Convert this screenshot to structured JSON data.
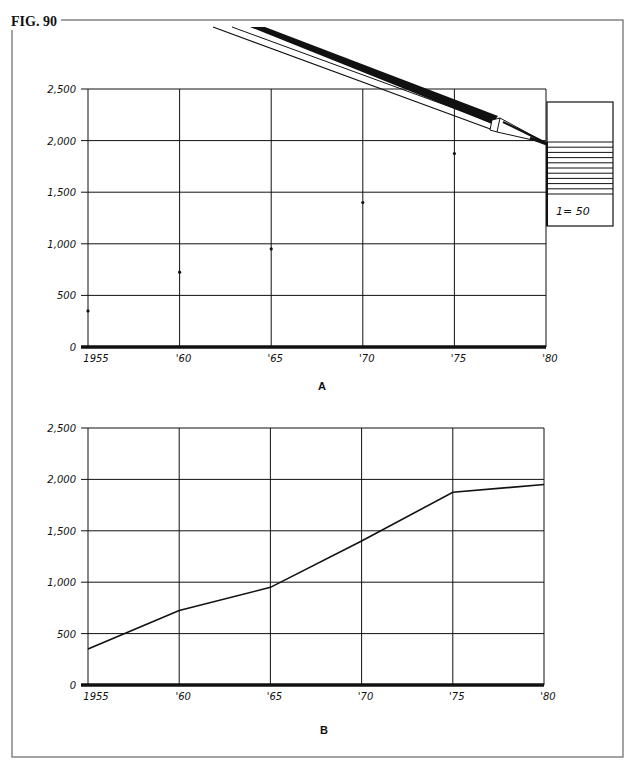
{
  "figure": {
    "label": "FIG. 90",
    "panel_a_label": "A",
    "panel_b_label": "B",
    "scale_note": "1= 50"
  },
  "axes": {
    "y_ticks": [
      "0",
      "500",
      "1,000",
      "1,500",
      "2,000",
      "2,500"
    ],
    "x_ticks": [
      "1955",
      "'60",
      "'65",
      "'70",
      "'75",
      "'80"
    ]
  },
  "colors": {
    "ink": "#111111",
    "paper": "#ffffff",
    "frame": "#555555"
  },
  "chart_data": [
    {
      "type": "scatter",
      "title": "A",
      "x": [
        1955,
        1960,
        1965,
        1970,
        1975,
        1980
      ],
      "categories": [
        "1955",
        "'60",
        "'65",
        "'70",
        "'75",
        "'80"
      ],
      "values": [
        350,
        725,
        950,
        1400,
        1875,
        1950
      ],
      "xlabel": "",
      "ylabel": "",
      "ylim": [
        0,
        2500
      ],
      "y_ticks": [
        0,
        500,
        1000,
        1500,
        2000,
        2500
      ],
      "grid": true,
      "annotations": [
        "pencil plotting point at 1980",
        "scale ruler: 1= 50"
      ]
    },
    {
      "type": "line",
      "title": "B",
      "x": [
        1955,
        1960,
        1965,
        1970,
        1975,
        1980
      ],
      "categories": [
        "1955",
        "'60",
        "'65",
        "'70",
        "'75",
        "'80"
      ],
      "values": [
        350,
        725,
        950,
        1400,
        1875,
        1950
      ],
      "xlabel": "",
      "ylabel": "",
      "ylim": [
        0,
        2500
      ],
      "y_ticks": [
        0,
        500,
        1000,
        1500,
        2000,
        2500
      ],
      "grid": true
    }
  ]
}
